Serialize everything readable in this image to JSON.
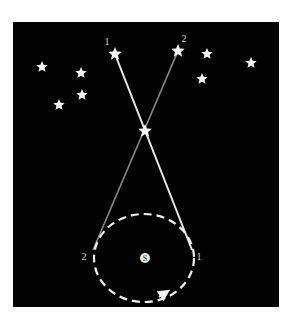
{
  "diagram": {
    "colors": {
      "background": "#ffffff",
      "sky": "#020202",
      "star": "#f4f4f4",
      "line1": "#e8e8e8",
      "line2": "#8a8a8a",
      "orbit": "#f0f0f0",
      "label": "#d8d8d8"
    },
    "frame": {
      "x": 13,
      "y": 22,
      "width": 266,
      "height": 285
    },
    "distant_stars": [
      {
        "id": "star-1",
        "x": 115,
        "y": 54,
        "r": 7,
        "label": "1",
        "label_x": 107,
        "label_y": 45
      },
      {
        "id": "star-2",
        "x": 178,
        "y": 51,
        "r": 7,
        "label": "2",
        "label_x": 184,
        "label_y": 42
      },
      {
        "id": "bg-a",
        "x": 42,
        "y": 67,
        "r": 6
      },
      {
        "id": "bg-b",
        "x": 81,
        "y": 73,
        "r": 6
      },
      {
        "id": "bg-c",
        "x": 82,
        "y": 95,
        "r": 6
      },
      {
        "id": "bg-d",
        "x": 59,
        "y": 105,
        "r": 6
      },
      {
        "id": "bg-e",
        "x": 207,
        "y": 54,
        "r": 6
      },
      {
        "id": "bg-f",
        "x": 251,
        "y": 63,
        "r": 6
      },
      {
        "id": "bg-g",
        "x": 202,
        "y": 79,
        "r": 6
      }
    ],
    "near_star": {
      "x": 145,
      "y": 131,
      "r": 7
    },
    "sightlines": [
      {
        "id": "sightline-1",
        "from": [
          192,
          250
        ],
        "to": [
          115,
          54
        ],
        "label": "1"
      },
      {
        "id": "sightline-2",
        "from": [
          93,
          250
        ],
        "to": [
          178,
          51
        ],
        "label": "2"
      }
    ],
    "orbit": {
      "cx": 144,
      "cy": 258,
      "rx": 50,
      "ry": 44,
      "dash": "8 5",
      "arrow_at": [
        165,
        296
      ]
    },
    "sun": {
      "x": 145,
      "y": 258,
      "r": 5,
      "symbol": "S"
    },
    "orbit_labels": [
      {
        "text": "2",
        "x": 84,
        "y": 260
      },
      {
        "text": "1",
        "x": 199,
        "y": 260
      }
    ]
  }
}
